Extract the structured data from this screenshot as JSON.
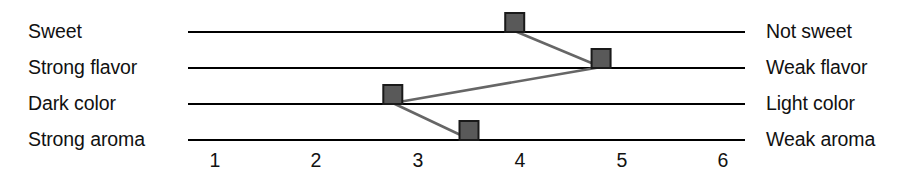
{
  "chart_data": {
    "type": "line",
    "title": "",
    "subtitle": "",
    "xlabel": "",
    "ylabel": "",
    "xlim": [
      1,
      6
    ],
    "grid": false,
    "legend": false,
    "orientation": "horizontal-scales",
    "xticks": [
      1,
      2,
      3,
      4,
      5,
      6
    ],
    "xtick_labels": [
      "1",
      "2",
      "3",
      "4",
      "5",
      "6"
    ],
    "categories": [
      "Sweet",
      "Strong flavor",
      "Dark color",
      "Strong aroma"
    ],
    "left_labels": [
      "Sweet",
      "Strong flavor",
      "Dark color",
      "Strong aroma"
    ],
    "right_labels": [
      "Not sweet",
      "Weak flavor",
      "Light color",
      "Weak aroma"
    ],
    "values": [
      3.95,
      4.8,
      2.75,
      3.5
    ],
    "series": [
      {
        "name": "profile",
        "values": [
          3.95,
          4.8,
          2.75,
          3.5
        ]
      }
    ],
    "points": [
      {
        "scale": "Sweet",
        "left": "Sweet",
        "right": "Not sweet",
        "value": 3.95
      },
      {
        "scale": "Strong flavor",
        "left": "Strong flavor",
        "right": "Weak flavor",
        "value": 4.8
      },
      {
        "scale": "Dark color",
        "left": "Dark color",
        "right": "Light color",
        "value": 2.75
      },
      {
        "scale": "Strong aroma",
        "left": "Strong aroma",
        "right": "Weak aroma",
        "value": 3.5
      }
    ],
    "colors": {
      "marker_fill": "#595959",
      "marker_stroke": "#1a1a1a",
      "connector_line": "#666666",
      "scale_line": "#000000",
      "text": "#111111",
      "background": "#ffffff"
    }
  },
  "labels": {
    "left": {
      "row0": "Sweet",
      "row1": "Strong flavor",
      "row2": "Dark color",
      "row3": "Strong aroma"
    },
    "right": {
      "row0": "Not sweet",
      "row1": "Weak flavor",
      "row2": "Light color",
      "row3": "Weak aroma"
    }
  },
  "ticks": {
    "t0": "1",
    "t1": "2",
    "t2": "3",
    "t3": "4",
    "t4": "5",
    "t5": "6"
  }
}
